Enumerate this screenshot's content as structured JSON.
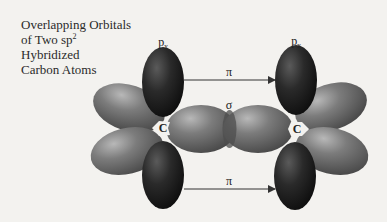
{
  "title": {
    "line1": "Overlapping Orbitals",
    "line2_prefix": "of Two sp",
    "line2_sup": "2",
    "line3": "Hybridized",
    "line4": "Carbon Atoms"
  },
  "labels": {
    "left_py_main": "p",
    "left_py_sub": "y",
    "right_py_main": "p",
    "right_py_sub": "y",
    "pi_top": "π",
    "pi_bottom": "π",
    "sigma": "σ",
    "carbon_left": "C",
    "carbon_right": "C"
  },
  "colors": {
    "background": "#f3f2ef",
    "p_orbital": "#1c1c1c",
    "sp2_orbital": "#6e6e6e",
    "arrow": "#333333",
    "text": "#222222"
  },
  "atoms": [
    {
      "name": "carbon-left",
      "x": 162,
      "y": 128
    },
    {
      "name": "carbon-right",
      "x": 297,
      "y": 129
    }
  ]
}
